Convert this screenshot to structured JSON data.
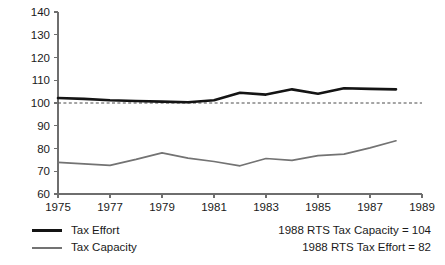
{
  "chart_data": {
    "type": "line",
    "title": "",
    "xlabel": "",
    "ylabel": "",
    "xlim": [
      1975,
      1989
    ],
    "ylim": [
      60,
      140
    ],
    "grid": false,
    "legend_position": "bottom-left",
    "x": [
      1975,
      1976,
      1977,
      1978,
      1979,
      1980,
      1981,
      1982,
      1983,
      1984,
      1985,
      1986,
      1987,
      1988
    ],
    "xticks": [
      1975,
      1977,
      1979,
      1981,
      1983,
      1985,
      1987,
      1989
    ],
    "xtick_labels": [
      "1975",
      "1977",
      "1979",
      "1981",
      "1983",
      "1985",
      "1987",
      "1989"
    ],
    "yticks": [
      60,
      70,
      80,
      90,
      100,
      110,
      120,
      130,
      140
    ],
    "ytick_labels": [
      "60",
      "70",
      "80",
      "90",
      "100",
      "110",
      "120",
      "130",
      "140"
    ],
    "reference_line": {
      "value": 100,
      "style": "dashed",
      "color": "#4a4a4a"
    },
    "series": [
      {
        "name": "Tax Effort",
        "color": "#141414",
        "values": [
          102.2,
          101.8,
          101.2,
          100.9,
          100.6,
          100.3,
          101.2,
          104.5,
          103.7,
          106.0,
          104.1,
          106.5,
          106.2,
          106.0
        ]
      },
      {
        "name": "Tax Capacity",
        "color": "#737373",
        "values": [
          73.9,
          73.2,
          72.6,
          75.2,
          78.1,
          75.8,
          74.3,
          72.4,
          75.6,
          74.8,
          76.9,
          77.5,
          80.3,
          83.4
        ]
      }
    ],
    "annotations": [
      "1988 RTS Tax Capacity = 104",
      "1988 RTS Tax Effort = 82"
    ]
  },
  "legend": {
    "items": [
      {
        "label": "Tax Effort",
        "color": "#141414"
      },
      {
        "label": "Tax Capacity",
        "color": "#737373"
      }
    ]
  },
  "annotations": {
    "line1": "1988 RTS Tax Capacity = 104",
    "line2": "1988 RTS Tax Effort = 82"
  }
}
